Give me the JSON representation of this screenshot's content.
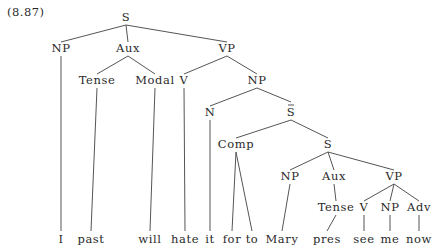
{
  "example_number": "(8.87)",
  "tree": {
    "nodes": [
      {
        "id": "S0",
        "label": "S",
        "x": 126,
        "y": 21
      },
      {
        "id": "NP1",
        "label": "NP",
        "x": 61,
        "y": 52
      },
      {
        "id": "Aux1",
        "label": "Aux",
        "x": 128,
        "y": 52
      },
      {
        "id": "VP1",
        "label": "VP",
        "x": 227,
        "y": 52
      },
      {
        "id": "Tense1",
        "label": "Tense",
        "x": 97,
        "y": 84
      },
      {
        "id": "Modal1",
        "label": "Modal",
        "x": 155,
        "y": 84
      },
      {
        "id": "V1",
        "label": "V",
        "x": 184,
        "y": 84
      },
      {
        "id": "NP2",
        "label": "NP",
        "x": 257,
        "y": 84
      },
      {
        "id": "N1",
        "label": "N",
        "x": 210,
        "y": 116
      },
      {
        "id": "Sbar",
        "label": "S",
        "bar": true,
        "x": 291,
        "y": 116
      },
      {
        "id": "Comp",
        "label": "Comp",
        "x": 236,
        "y": 148
      },
      {
        "id": "S2",
        "label": "S",
        "x": 328,
        "y": 148
      },
      {
        "id": "NP3",
        "label": "NP",
        "x": 290,
        "y": 180
      },
      {
        "id": "Aux2",
        "label": "Aux",
        "x": 334,
        "y": 180
      },
      {
        "id": "VP2",
        "label": "VP",
        "x": 394,
        "y": 180
      },
      {
        "id": "Tense2",
        "label": "Tense",
        "x": 336,
        "y": 211
      },
      {
        "id": "V2",
        "label": "V",
        "x": 364,
        "y": 211
      },
      {
        "id": "NP4",
        "label": "NP",
        "x": 390,
        "y": 211
      },
      {
        "id": "Adv",
        "label": "Adv",
        "x": 419,
        "y": 211
      }
    ],
    "leaves": [
      {
        "id": "w1",
        "label": "I",
        "x": 61
      },
      {
        "id": "w2",
        "label": "past",
        "x": 91
      },
      {
        "id": "w3",
        "label": "will",
        "x": 150
      },
      {
        "id": "w4",
        "label": "hate",
        "x": 185
      },
      {
        "id": "w5",
        "label": "it",
        "x": 210
      },
      {
        "id": "w6",
        "label": "for",
        "x": 232
      },
      {
        "id": "w7",
        "label": "to",
        "x": 252
      },
      {
        "id": "w8",
        "label": "Mary",
        "x": 282
      },
      {
        "id": "w9",
        "label": "pres",
        "x": 327
      },
      {
        "id": "w10",
        "label": "see",
        "x": 364
      },
      {
        "id": "w11",
        "label": "me",
        "x": 390
      },
      {
        "id": "w12",
        "label": "now",
        "x": 419
      }
    ],
    "leaf_baseline": 243,
    "edges": [
      [
        "S0",
        "NP1"
      ],
      [
        "S0",
        "Aux1"
      ],
      [
        "S0",
        "VP1"
      ],
      [
        "NP1",
        "w1"
      ],
      [
        "Aux1",
        "Tense1"
      ],
      [
        "Aux1",
        "Modal1"
      ],
      [
        "Tense1",
        "w2"
      ],
      [
        "Modal1",
        "w3"
      ],
      [
        "VP1",
        "V1"
      ],
      [
        "VP1",
        "NP2"
      ],
      [
        "V1",
        "w4"
      ],
      [
        "NP2",
        "N1"
      ],
      [
        "NP2",
        "Sbar"
      ],
      [
        "N1",
        "w5"
      ],
      [
        "Sbar",
        "Comp"
      ],
      [
        "Sbar",
        "S2"
      ],
      [
        "Comp",
        "w6"
      ],
      [
        "Comp",
        "w7"
      ],
      [
        "S2",
        "NP3"
      ],
      [
        "S2",
        "Aux2"
      ],
      [
        "S2",
        "VP2"
      ],
      [
        "NP3",
        "w8"
      ],
      [
        "Aux2",
        "Tense2"
      ],
      [
        "Tense2",
        "w9"
      ],
      [
        "VP2",
        "V2"
      ],
      [
        "VP2",
        "NP4"
      ],
      [
        "VP2",
        "Adv"
      ],
      [
        "V2",
        "w10"
      ],
      [
        "NP4",
        "w11"
      ],
      [
        "Adv",
        "w12"
      ]
    ]
  }
}
